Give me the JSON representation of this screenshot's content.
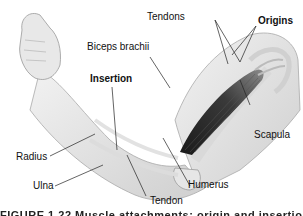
{
  "figure": {
    "labels": {
      "tendons": "Tendons",
      "origins": "Origins",
      "biceps": "Biceps brachii",
      "insertion": "Insertion",
      "scapula": "Scapula",
      "radius": "Radius",
      "ulna": "Ulna",
      "tendon": "Tendon",
      "humerus": "Humerus"
    },
    "caption": "FIGURE 1.22  Muscle attachments: origin and insertion"
  }
}
